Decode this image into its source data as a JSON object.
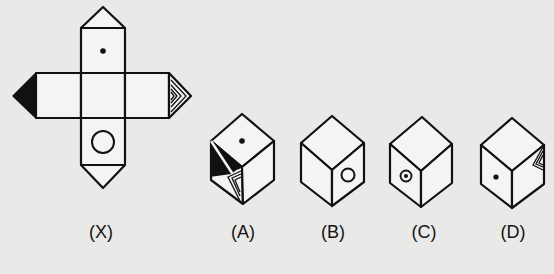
{
  "figure": {
    "type": "cube-net-folding-puzzle",
    "background_color": "#e9e9e7",
    "ink_color": "#111111",
    "net": {
      "label": "(X)",
      "faces": {
        "top": "dot",
        "center": "blank",
        "bottom": "circle",
        "left": "blank",
        "right": "blank"
      },
      "flaps": {
        "top_triangle": "blank",
        "bottom_triangle": "blank",
        "left_triangle": "solid-black",
        "right_triangle": "nested-chevrons"
      }
    },
    "options": [
      {
        "label": "(A)",
        "top": "dot",
        "left": "black-triangle-with-chevrons",
        "right": "blank"
      },
      {
        "label": "(B)",
        "top": "blank",
        "left": "blank",
        "right": "circle"
      },
      {
        "label": "(C)",
        "top": "blank",
        "left": "circle-with-dot",
        "right": "blank"
      },
      {
        "label": "(D)",
        "top": "blank",
        "left": "dot",
        "right": "nested-chevrons"
      }
    ]
  }
}
